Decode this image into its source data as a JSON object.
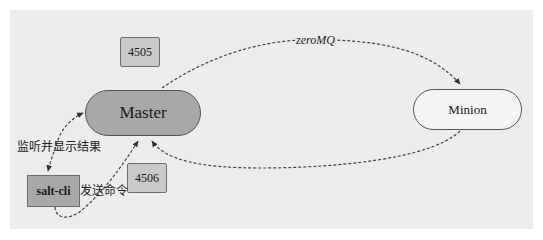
{
  "diagram": {
    "nodes": {
      "master": {
        "label": "Master"
      },
      "minion": {
        "label": "Minion"
      },
      "salt_cli": {
        "label": "salt-cli"
      },
      "port_publish": {
        "label": "4505"
      },
      "port_return": {
        "label": "4506"
      }
    },
    "edges": {
      "master_to_minion": {
        "label": "zeroMQ"
      },
      "master_to_cli": {
        "label": "监听并显示结果"
      },
      "cli_to_master": {
        "label": "发送命令"
      },
      "minion_to_master": {
        "label": ""
      }
    },
    "colors": {
      "background": "#ececec",
      "master_fill": "#a8a8a8",
      "minion_fill": "#f4f4f4",
      "port_fill": "#c9c9c9",
      "cli_fill": "#a8a8a8",
      "edge": "#444444"
    }
  }
}
